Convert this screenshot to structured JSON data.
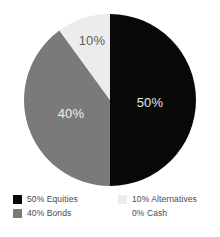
{
  "chart_data": {
    "type": "pie",
    "title": "",
    "subtitle": "",
    "xlabel": "",
    "ylabel": "",
    "grid": false,
    "legend_position": "bottom",
    "start_angle_deg": 0,
    "direction": "clockwise",
    "categories": [
      "Equities",
      "Bonds",
      "Alternatives",
      "Cash"
    ],
    "values": [
      50,
      40,
      10,
      0
    ],
    "value_unit": "%",
    "slice_labels": [
      "50%",
      "40%",
      "10%",
      ""
    ],
    "colors": [
      "#080808",
      "#7a7a7a",
      "#ececec",
      "#ffffff"
    ],
    "slices": [
      {
        "name": "Equities",
        "value": 50,
        "label": "50%",
        "legend_text": "50% Equities",
        "color": "#080808",
        "label_color": "#e8e8e8",
        "start_deg": 0,
        "end_deg": 180,
        "label_pos": {
          "x": 150,
          "y": 104
        }
      },
      {
        "name": "Bonds",
        "value": 40,
        "label": "40%",
        "legend_text": "40% Bonds",
        "color": "#7a7a7a",
        "label_color": "#f0f0f0",
        "start_deg": 180,
        "end_deg": 324,
        "label_pos": {
          "x": 71,
          "y": 115
        }
      },
      {
        "name": "Alternatives",
        "value": 10,
        "label": "10%",
        "legend_text": "10% Alternatives",
        "color": "#ececec",
        "label_color": "#5e5e5e",
        "start_deg": 324,
        "end_deg": 360,
        "label_pos": {
          "x": 92,
          "y": 42
        }
      },
      {
        "name": "Cash",
        "value": 0,
        "label": "",
        "legend_text": "0% Cash",
        "color": "#ffffff",
        "label_color": "#5e5e5e",
        "start_deg": 360,
        "end_deg": 360,
        "label_pos": {
          "x": 0,
          "y": 0
        }
      }
    ],
    "geometry": {
      "center_x": 110,
      "center_y": 100,
      "radius": 86
    }
  },
  "legend": {
    "items": [
      {
        "text": "50% Equities",
        "swatch_color": "#080808",
        "swatch_border": "none"
      },
      {
        "text": "10% Alternatives",
        "swatch_color": "#ececec",
        "swatch_border": "none"
      },
      {
        "text": "40% Bonds",
        "swatch_color": "#7a7a7a",
        "swatch_border": "none"
      },
      {
        "text": "0% Cash",
        "swatch_color": "#ffffff",
        "swatch_border": "none"
      }
    ]
  }
}
